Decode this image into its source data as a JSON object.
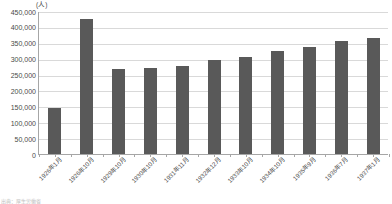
{
  "chart_data": {
    "type": "bar",
    "title": "",
    "subtitle": "",
    "unit_label": "(人)",
    "xlabel": "",
    "ylabel": "",
    "ylim": [
      0,
      450000
    ],
    "ytick_step": 50000,
    "grid": true,
    "legend": null,
    "bar_color": "#595959",
    "grid_color": "#d9d9d9",
    "axis_color": "#a6a6a6",
    "ytick_labels": [
      "450,000",
      "400,000",
      "350,000",
      "300,000",
      "250,000",
      "200,000",
      "150,000",
      "100,000",
      "50,000",
      "0"
    ],
    "ytick_values": [
      450000,
      400000,
      350000,
      300000,
      250000,
      200000,
      150000,
      100000,
      50000,
      0
    ],
    "categories": [
      "1926年1月",
      "1926年10月",
      "1929年10月",
      "1930年10月",
      "1931年11月",
      "1932年12月",
      "1933年10月",
      "1934年10月",
      "1935年9月",
      "1936年7月",
      "1937年1月"
    ],
    "values": [
      145000,
      425000,
      266000,
      270000,
      277000,
      296000,
      306000,
      325000,
      338000,
      355000,
      365000
    ]
  },
  "footnote": {
    "text": "出典：厚生労働省"
  }
}
